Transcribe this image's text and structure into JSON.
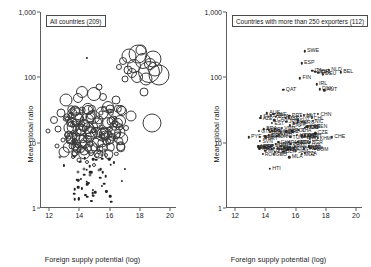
{
  "figure": {
    "axis": {
      "xlabel": "Foreign supply potential (log)",
      "ylabel": "Mean global ratio",
      "xticks": [
        "12",
        "14",
        "16",
        "18",
        "20"
      ],
      "yticks": [
        "1",
        "10",
        "100",
        "1,000"
      ],
      "xlim": [
        11.4,
        20.4
      ],
      "ylim": [
        1,
        1000
      ],
      "yscale": "log",
      "grid": false
    },
    "panels": [
      {
        "title": "All countries (209)",
        "n": 209
      },
      {
        "title": "Countries with more than 250 exporters (112)",
        "n": 112
      }
    ]
  },
  "chart_data": {
    "type": "scatter",
    "title": "",
    "xlabel": "Foreign supply potential (log)",
    "ylabel": "Mean global ratio",
    "xlim": [
      11.4,
      20.4
    ],
    "ylim": [
      1,
      1000
    ],
    "yscale": "log",
    "grid": false,
    "legend": "none",
    "panels": [
      {
        "label": "All countries (209)",
        "marker": "open-circle-bubble",
        "note": "Bubble size varies by country size; x = foreign supply potential (log), y = mean global ratio (log scale)",
        "points": [
          {
            "x": 18.6,
            "y": 120,
            "s": 22
          },
          {
            "x": 19.3,
            "y": 110,
            "s": 21
          },
          {
            "x": 17.9,
            "y": 230,
            "s": 19
          },
          {
            "x": 18.2,
            "y": 175,
            "s": 16
          },
          {
            "x": 17.6,
            "y": 150,
            "s": 14
          },
          {
            "x": 18.9,
            "y": 190,
            "s": 17
          },
          {
            "x": 17.3,
            "y": 210,
            "s": 15
          },
          {
            "x": 18.4,
            "y": 95,
            "s": 13
          },
          {
            "x": 19.0,
            "y": 135,
            "s": 15
          },
          {
            "x": 17.8,
            "y": 100,
            "s": 12
          },
          {
            "x": 18.1,
            "y": 260,
            "s": 11
          },
          {
            "x": 17.5,
            "y": 115,
            "s": 10
          },
          {
            "x": 18.7,
            "y": 160,
            "s": 12
          },
          {
            "x": 17.2,
            "y": 130,
            "s": 9
          },
          {
            "x": 16.9,
            "y": 175,
            "s": 8
          },
          {
            "x": 18.3,
            "y": 60,
            "s": 9
          },
          {
            "x": 17.0,
            "y": 95,
            "s": 7
          },
          {
            "x": 16.6,
            "y": 145,
            "s": 6
          },
          {
            "x": 14.5,
            "y": 200,
            "s": 2
          },
          {
            "x": 18.8,
            "y": 20,
            "s": 19
          },
          {
            "x": 17.4,
            "y": 26,
            "s": 11
          },
          {
            "x": 16.8,
            "y": 30,
            "s": 10
          },
          {
            "x": 16.2,
            "y": 22,
            "s": 9
          },
          {
            "x": 15.9,
            "y": 35,
            "s": 12
          },
          {
            "x": 15.5,
            "y": 28,
            "s": 13
          },
          {
            "x": 15.2,
            "y": 20,
            "s": 11
          },
          {
            "x": 14.9,
            "y": 25,
            "s": 14
          },
          {
            "x": 14.6,
            "y": 32,
            "s": 10
          },
          {
            "x": 14.3,
            "y": 18,
            "s": 12
          },
          {
            "x": 14.0,
            "y": 24,
            "s": 9
          },
          {
            "x": 13.7,
            "y": 30,
            "s": 11
          },
          {
            "x": 13.4,
            "y": 20,
            "s": 8
          },
          {
            "x": 13.1,
            "y": 45,
            "s": 13
          },
          {
            "x": 12.8,
            "y": 28,
            "s": 9
          },
          {
            "x": 12.6,
            "y": 16,
            "s": 7
          },
          {
            "x": 12.3,
            "y": 22,
            "s": 8
          },
          {
            "x": 11.9,
            "y": 15,
            "s": 5
          },
          {
            "x": 15.0,
            "y": 55,
            "s": 14
          },
          {
            "x": 14.2,
            "y": 60,
            "s": 12
          },
          {
            "x": 13.9,
            "y": 48,
            "s": 10
          },
          {
            "x": 15.6,
            "y": 50,
            "s": 8
          },
          {
            "x": 16.4,
            "y": 45,
            "s": 9
          },
          {
            "x": 15.3,
            "y": 70,
            "s": 7
          },
          {
            "x": 14.7,
            "y": 12,
            "s": 10
          },
          {
            "x": 15.1,
            "y": 14,
            "s": 12
          },
          {
            "x": 15.7,
            "y": 13,
            "s": 9
          },
          {
            "x": 16.1,
            "y": 11,
            "s": 8
          },
          {
            "x": 14.4,
            "y": 10,
            "s": 11
          },
          {
            "x": 13.8,
            "y": 12,
            "s": 9
          },
          {
            "x": 13.5,
            "y": 9,
            "s": 7
          },
          {
            "x": 14.1,
            "y": 8,
            "s": 8
          },
          {
            "x": 14.8,
            "y": 7,
            "s": 6
          },
          {
            "x": 15.4,
            "y": 8,
            "s": 7
          },
          {
            "x": 16.0,
            "y": 16,
            "s": 6
          },
          {
            "x": 16.5,
            "y": 13,
            "s": 7
          },
          {
            "x": 17.1,
            "y": 17,
            "s": 6
          },
          {
            "x": 13.2,
            "y": 13,
            "s": 6
          },
          {
            "x": 12.9,
            "y": 11,
            "s": 5
          },
          {
            "x": 12.5,
            "y": 9,
            "s": 5
          },
          {
            "x": 14.0,
            "y": 5.5,
            "s": 5
          },
          {
            "x": 14.5,
            "y": 5,
            "s": 4
          },
          {
            "x": 13.6,
            "y": 6,
            "s": 4
          },
          {
            "x": 15.0,
            "y": 4.5,
            "s": 4
          },
          {
            "x": 14.3,
            "y": 4,
            "s": 3
          },
          {
            "x": 13.9,
            "y": 3.5,
            "s": 3
          },
          {
            "x": 14.7,
            "y": 3.2,
            "s": 3
          },
          {
            "x": 15.3,
            "y": 3.8,
            "s": 3
          },
          {
            "x": 14.1,
            "y": 2.8,
            "s": 2
          },
          {
            "x": 14.6,
            "y": 2.4,
            "s": 2
          },
          {
            "x": 14.2,
            "y": 2.0,
            "s": 2
          },
          {
            "x": 14.9,
            "y": 1.9,
            "s": 2
          },
          {
            "x": 14.4,
            "y": 1.6,
            "s": 2
          },
          {
            "x": 14.0,
            "y": 1.4,
            "s": 2
          },
          {
            "x": 14.8,
            "y": 1.3,
            "s": 2
          },
          {
            "x": 15.5,
            "y": 2.2,
            "s": 2
          },
          {
            "x": 16.3,
            "y": 5,
            "s": 2
          },
          {
            "x": 17.0,
            "y": 4,
            "s": 2
          },
          {
            "x": 12.7,
            "y": 6,
            "s": 3
          },
          {
            "x": 13.0,
            "y": 4.5,
            "s": 2
          },
          {
            "x": 16.8,
            "y": 2.6,
            "s": 2
          },
          {
            "x": 15.8,
            "y": 1.8,
            "s": 2
          }
        ]
      },
      {
        "label": "Countries with more than 250 exporters (112)",
        "marker": "filled-dot-with-iso3-label",
        "note": "Each point labelled with ISO-3 country code; dense overlapping cluster near y = 10 to 25",
        "points": [
          {
            "code": "SWE",
            "x": 16.6,
            "y": 250
          },
          {
            "code": "ESP",
            "x": 16.4,
            "y": 165
          },
          {
            "code": "NLD",
            "x": 18.2,
            "y": 130
          },
          {
            "code": "BEL",
            "x": 19.0,
            "y": 120
          },
          {
            "code": "DEU",
            "x": 17.8,
            "y": 112
          },
          {
            "code": "GBR",
            "x": 17.3,
            "y": 122
          },
          {
            "code": "ITA",
            "x": 17.1,
            "y": 125
          },
          {
            "code": "FRA",
            "x": 17.5,
            "y": 118
          },
          {
            "code": "AUT",
            "x": 17.9,
            "y": 63
          },
          {
            "code": "FIN",
            "x": 16.3,
            "y": 96
          },
          {
            "code": "IRL",
            "x": 17.4,
            "y": 78
          },
          {
            "code": "DNK",
            "x": 17.6,
            "y": 66
          },
          {
            "code": "QAT",
            "x": 15.2,
            "y": 64
          },
          {
            "code": "AUS",
            "x": 14.1,
            "y": 28
          },
          {
            "code": "USA",
            "x": 14.7,
            "y": 25
          },
          {
            "code": "PRT",
            "x": 15.6,
            "y": 26
          },
          {
            "code": "CAN",
            "x": 14.6,
            "y": 22
          },
          {
            "code": "JPN",
            "x": 15.4,
            "y": 21
          },
          {
            "code": "PHL",
            "x": 15.9,
            "y": 20
          },
          {
            "code": "BRA",
            "x": 13.9,
            "y": 16
          },
          {
            "code": "HUN",
            "x": 16.6,
            "y": 17
          },
          {
            "code": "POL",
            "x": 15.8,
            "y": 15
          },
          {
            "code": "CZE",
            "x": 17.3,
            "y": 14
          },
          {
            "code": "CHE",
            "x": 18.4,
            "y": 12
          },
          {
            "code": "PYF",
            "x": 12.9,
            "y": 12
          },
          {
            "code": "LVA",
            "x": 16.9,
            "y": 9
          },
          {
            "code": "MDA",
            "x": 16.0,
            "y": 10
          },
          {
            "code": "MKD",
            "x": 14.0,
            "y": 7.5
          },
          {
            "code": "BLR",
            "x": 15.2,
            "y": 7.2
          },
          {
            "code": "MLA",
            "x": 15.6,
            "y": 6.0
          },
          {
            "code": "HTI",
            "x": 14.3,
            "y": 4.0
          }
        ]
      }
    ]
  }
}
